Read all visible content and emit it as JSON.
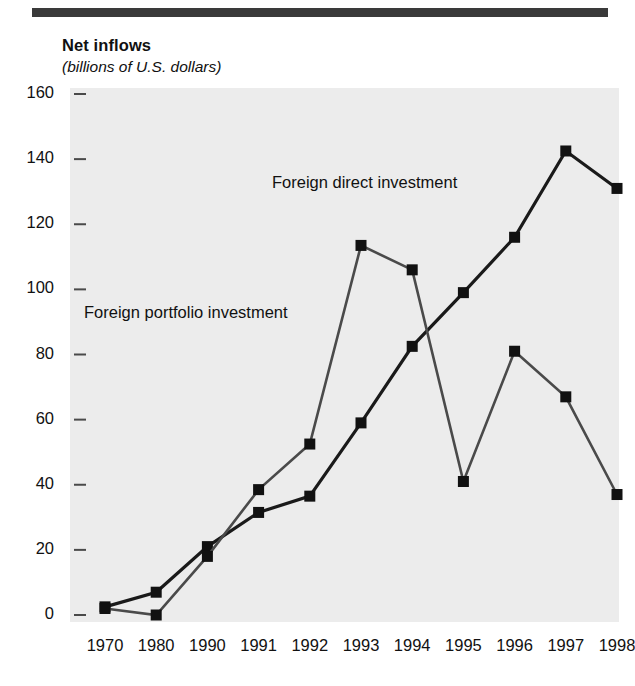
{
  "header": {
    "title": "Net inflows",
    "subtitle": "(billions of U.S. dollars)"
  },
  "colors": {
    "rule": "#3a3a3a",
    "plot_background": "#ececec",
    "series_fdi": "#1a1a1a",
    "series_fpi": "#4a4a4a",
    "text": "#111111"
  },
  "chart_data": {
    "type": "line",
    "title": "Net inflows",
    "subtitle": "(billions of U.S. dollars)",
    "xlabel": "",
    "ylabel": "billions of U.S. dollars",
    "categories": [
      "1970",
      "1980",
      "1990",
      "1991",
      "1992",
      "1993",
      "1994",
      "1995",
      "1996",
      "1997",
      "1998"
    ],
    "ylim": [
      0,
      160
    ],
    "yticks": [
      "0",
      "20",
      "40",
      "60",
      "80",
      "100",
      "120",
      "140",
      "160"
    ],
    "grid": false,
    "legend": "inline-annotations",
    "markers": "filled-square",
    "series": [
      {
        "name": "Foreign direct investment",
        "values": [
          2.5,
          7,
          21,
          31.5,
          36.5,
          59,
          82.5,
          99,
          116,
          142.5,
          131
        ]
      },
      {
        "name": "Foreign portfolio investment",
        "values": [
          2,
          0,
          18,
          38.5,
          52.5,
          113.5,
          106,
          41,
          81,
          67,
          37
        ]
      }
    ]
  }
}
